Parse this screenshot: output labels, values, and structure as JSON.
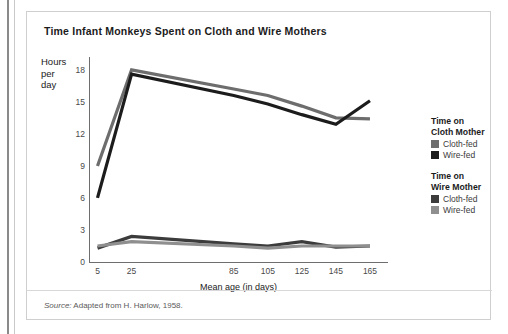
{
  "figure": {
    "title": "Time Infant Monkeys Spent on Cloth and Wire Mothers",
    "source_prefix": "Source:",
    "source_text": " Adapted from H. Harlow, 1958."
  },
  "legend": {
    "groups": [
      {
        "heading_line1": "Time on",
        "heading_line2": "Cloth Mother",
        "entries": [
          {
            "label": "Cloth-fed",
            "color": "#6d6d6d"
          },
          {
            "label": "Wire-fed",
            "color": "#1c1c1c"
          }
        ]
      },
      {
        "heading_line1": "Time on",
        "heading_line2": "Wire Mother",
        "entries": [
          {
            "label": "Cloth-fed",
            "color": "#3c3c3c"
          },
          {
            "label": "Wire-fed",
            "color": "#8f8f8f"
          }
        ]
      }
    ]
  },
  "chart_data": {
    "type": "line",
    "title": "Time Infant Monkeys Spent on Cloth and Wire Mothers",
    "xlabel": "Mean age (in days)",
    "ylabel": "Hours per day",
    "ylabel_lines": [
      "Hours",
      "per",
      "day"
    ],
    "x": [
      5,
      25,
      85,
      105,
      125,
      145,
      165
    ],
    "xtick_labels": [
      "5",
      "25",
      "",
      "",
      "85",
      "105",
      "125",
      "145",
      "165"
    ],
    "xtick_values": [
      5,
      25,
      45,
      65,
      85,
      105,
      125,
      145,
      165
    ],
    "ytick_labels": [
      "0",
      "3",
      "6",
      "9",
      "12",
      "15",
      "18"
    ],
    "ytick_values": [
      0,
      3,
      6,
      9,
      12,
      15,
      18
    ],
    "ylim": [
      0,
      19.2
    ],
    "xlim": [
      0,
      175
    ],
    "grid": false,
    "legend_position": "right",
    "series": [
      {
        "name": "Time on Cloth Mother - Cloth-fed",
        "color": "#6d6d6d",
        "values": [
          9.0,
          18.0,
          16.2,
          15.6,
          14.6,
          13.5,
          13.4
        ]
      },
      {
        "name": "Time on Cloth Mother - Wire-fed",
        "color": "#1c1c1c",
        "values": [
          6.0,
          17.6,
          15.6,
          14.8,
          13.8,
          12.9,
          15.1
        ]
      },
      {
        "name": "Time on Wire Mother - Cloth-fed",
        "color": "#3c3c3c",
        "values": [
          1.3,
          2.4,
          1.7,
          1.5,
          1.9,
          1.4,
          1.5
        ]
      },
      {
        "name": "Time on Wire Mother - Wire-fed",
        "color": "#8f8f8f",
        "values": [
          1.5,
          1.9,
          1.5,
          1.3,
          1.5,
          1.5,
          1.5
        ]
      }
    ]
  }
}
